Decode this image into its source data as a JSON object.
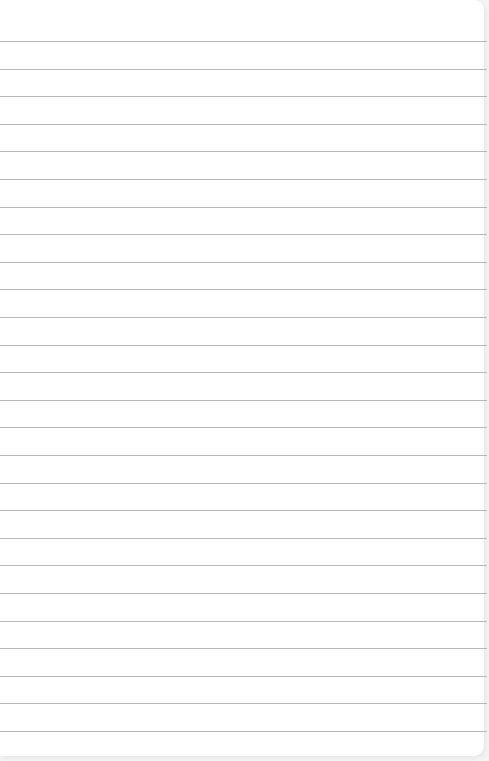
{
  "paper": {
    "type": "lined notebook paper",
    "line_count": 26,
    "first_line_y": 41,
    "line_spacing": 27.6,
    "line_color": "#b8b8b8",
    "background_color": "#ffffff"
  }
}
